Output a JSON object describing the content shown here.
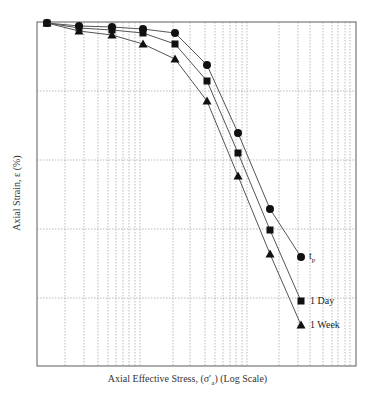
{
  "chart_data": {
    "type": "line",
    "title": "",
    "xlabel": "Axial Effective Stress, (σ'a) (Log Scale)",
    "ylabel": "Axial Strain, ε (%)",
    "x_scale": "log",
    "y_axis_inverted": true,
    "grid": true,
    "legend_position": "inline-right-of-last-points",
    "x_points_px": [
      47,
      79,
      112,
      143,
      175,
      207,
      238,
      270,
      301
    ],
    "series": [
      {
        "name": "t_p",
        "label_main": "t",
        "label_sub": "p",
        "marker": "circle",
        "y_px": [
          23,
          26,
          27,
          29,
          33,
          65,
          133,
          209,
          257
        ]
      },
      {
        "name": "1 Day",
        "label_main": "1 Day",
        "marker": "square",
        "y_px": [
          23,
          28,
          30,
          33,
          44,
          81,
          153,
          230,
          301
        ]
      },
      {
        "name": "1 Week",
        "label_main": "1 Week",
        "marker": "triangle",
        "y_px": [
          23,
          31,
          35,
          44,
          59,
          101,
          176,
          254,
          325
        ]
      }
    ],
    "plot_box_px": {
      "left": 37,
      "top": 22,
      "right": 356,
      "bottom": 366
    },
    "horizontal_grid_px": [
      91,
      160,
      229,
      298
    ],
    "vertical_grid_px": [
      65,
      84,
      98,
      108,
      116,
      123,
      129,
      135,
      140,
      173,
      190,
      205,
      215,
      223,
      230,
      236,
      242,
      247,
      279,
      298,
      310,
      323,
      332,
      338,
      345,
      350
    ],
    "colors": {
      "line": "#555555",
      "marker": "#111111",
      "grid": "#aaaaaa",
      "frame": "#777777"
    }
  },
  "labels": {
    "xlabel": "Axial Effective Stress, (σ′a) (Log Scale)",
    "ylabel": "Axial Strain, ε (%)",
    "legend_tp_main": "t",
    "legend_tp_sub": "p",
    "legend_day": "1 Day",
    "legend_week": "1 Week"
  }
}
